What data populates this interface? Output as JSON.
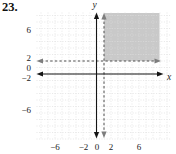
{
  "problem_number": "23.",
  "chart_data": {
    "type": "area",
    "title": "",
    "xlabel": "x",
    "ylabel": "y",
    "xlim": [
      -8.5,
      10.5
    ],
    "ylim": [
      -9.5,
      9.5
    ],
    "grid": true,
    "grid_step": 1,
    "x_tick_labels": [
      "−6",
      "−2",
      "0",
      "2",
      "6"
    ],
    "y_tick_labels": [
      "6",
      "2",
      "0",
      "−2",
      "−6"
    ],
    "boundaries": [
      {
        "equation": "x = 1",
        "line_style": "dashed",
        "inclusive": false
      },
      {
        "equation": "y = 2",
        "line_style": "dashed",
        "inclusive": false
      }
    ],
    "shaded_region": {
      "description": "x > 1 and y > 2",
      "x_range": [
        1,
        9
      ],
      "y_range": [
        2,
        9.5
      ]
    },
    "colors": {
      "shade": "#c9c9c9",
      "axis": "#141414",
      "dashed_line": "#4f4f4f",
      "dashed_arrow": "#7d7d7d",
      "grid": "#dcdcdc",
      "text": "#1c1c1c"
    }
  }
}
